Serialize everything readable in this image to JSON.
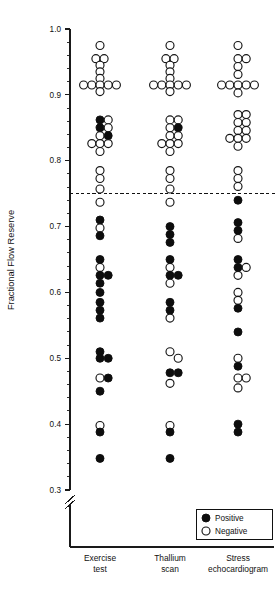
{
  "chart_data": {
    "type": "scatter",
    "title": "",
    "subtitle": "",
    "xlabel": "",
    "ylabel": "Fractional Flow Reserve",
    "ylim": [
      0.3,
      1.0
    ],
    "ytick_labels": [
      "1.0",
      "0.9",
      "0.8",
      "0.7",
      "0.6",
      "0.5",
      "0.4",
      "0.3"
    ],
    "ytick_values": [
      1.0,
      0.9,
      0.8,
      0.7,
      0.6,
      0.5,
      0.4,
      0.3
    ],
    "yminor_step": 0.02,
    "grid": false,
    "axis_break": true,
    "axis_break_note": "y-axis broken below 0.30",
    "threshold": {
      "value": 0.75,
      "style": "dashed",
      "label": ""
    },
    "legend": {
      "position": "bottom-right",
      "entries": [
        {
          "marker": "filled-circle",
          "label": "Positive",
          "color": "#0d0d0d"
        },
        {
          "marker": "open-circle",
          "label": "Negative",
          "color": "#ffffff"
        }
      ]
    },
    "categories": [
      "Exercise test",
      "Thallium scan",
      "Stress echocardiogram"
    ],
    "category_lines": [
      [
        "Exercise",
        "test"
      ],
      [
        "Thallium",
        "scan"
      ],
      [
        "Stress",
        "echocardiogram"
      ]
    ],
    "series": [
      {
        "name": "Exercise test",
        "category_index": 0,
        "points": [
          {
            "y": 0.975,
            "result": "Negative",
            "offset": 0
          },
          {
            "y": 0.955,
            "result": "Negative",
            "offset": -0.5
          },
          {
            "y": 0.955,
            "result": "Negative",
            "offset": 0.5
          },
          {
            "y": 0.945,
            "result": "Negative",
            "offset": 0
          },
          {
            "y": 0.935,
            "result": "Negative",
            "offset": 0
          },
          {
            "y": 0.925,
            "result": "Negative",
            "offset": 0
          },
          {
            "y": 0.915,
            "result": "Negative",
            "offset": -2
          },
          {
            "y": 0.915,
            "result": "Negative",
            "offset": -1
          },
          {
            "y": 0.915,
            "result": "Negative",
            "offset": 0
          },
          {
            "y": 0.915,
            "result": "Negative",
            "offset": 1
          },
          {
            "y": 0.915,
            "result": "Negative",
            "offset": 2
          },
          {
            "y": 0.905,
            "result": "Negative",
            "offset": 0
          },
          {
            "y": 0.862,
            "result": "Positive",
            "offset": 0
          },
          {
            "y": 0.862,
            "result": "Negative",
            "offset": 1
          },
          {
            "y": 0.85,
            "result": "Positive",
            "offset": 0
          },
          {
            "y": 0.85,
            "result": "Negative",
            "offset": 1
          },
          {
            "y": 0.838,
            "result": "Negative",
            "offset": 0
          },
          {
            "y": 0.838,
            "result": "Positive",
            "offset": 1
          },
          {
            "y": 0.826,
            "result": "Negative",
            "offset": -1
          },
          {
            "y": 0.826,
            "result": "Negative",
            "offset": 0
          },
          {
            "y": 0.826,
            "result": "Negative",
            "offset": 1
          },
          {
            "y": 0.814,
            "result": "Negative",
            "offset": 0
          },
          {
            "y": 0.785,
            "result": "Negative",
            "offset": 0
          },
          {
            "y": 0.773,
            "result": "Negative",
            "offset": 0
          },
          {
            "y": 0.757,
            "result": "Negative",
            "offset": 0
          },
          {
            "y": 0.737,
            "result": "Negative",
            "offset": 0
          },
          {
            "y": 0.71,
            "result": "Positive",
            "offset": 0
          },
          {
            "y": 0.698,
            "result": "Negative",
            "offset": 0
          },
          {
            "y": 0.686,
            "result": "Positive",
            "offset": 0
          },
          {
            "y": 0.65,
            "result": "Positive",
            "offset": 0
          },
          {
            "y": 0.638,
            "result": "Negative",
            "offset": 0
          },
          {
            "y": 0.626,
            "result": "Positive",
            "offset": 0
          },
          {
            "y": 0.626,
            "result": "Positive",
            "offset": 1
          },
          {
            "y": 0.614,
            "result": "Positive",
            "offset": 0
          },
          {
            "y": 0.6,
            "result": "Positive",
            "offset": 0
          },
          {
            "y": 0.585,
            "result": "Positive",
            "offset": 0
          },
          {
            "y": 0.573,
            "result": "Positive",
            "offset": 0
          },
          {
            "y": 0.561,
            "result": "Positive",
            "offset": 0
          },
          {
            "y": 0.51,
            "result": "Positive",
            "offset": 0
          },
          {
            "y": 0.5,
            "result": "Positive",
            "offset": 0
          },
          {
            "y": 0.5,
            "result": "Positive",
            "offset": 1
          },
          {
            "y": 0.47,
            "result": "Negative",
            "offset": 0
          },
          {
            "y": 0.47,
            "result": "Positive",
            "offset": 1
          },
          {
            "y": 0.45,
            "result": "Positive",
            "offset": 0
          },
          {
            "y": 0.398,
            "result": "Negative",
            "offset": 0
          },
          {
            "y": 0.388,
            "result": "Positive",
            "offset": 0
          },
          {
            "y": 0.348,
            "result": "Positive",
            "offset": 0
          }
        ]
      },
      {
        "name": "Thallium scan",
        "category_index": 1,
        "points": [
          {
            "y": 0.975,
            "result": "Negative",
            "offset": 0
          },
          {
            "y": 0.955,
            "result": "Negative",
            "offset": -0.5
          },
          {
            "y": 0.955,
            "result": "Negative",
            "offset": 0.5
          },
          {
            "y": 0.945,
            "result": "Negative",
            "offset": 0
          },
          {
            "y": 0.935,
            "result": "Negative",
            "offset": 0
          },
          {
            "y": 0.925,
            "result": "Negative",
            "offset": 0
          },
          {
            "y": 0.915,
            "result": "Negative",
            "offset": -2
          },
          {
            "y": 0.915,
            "result": "Negative",
            "offset": -1
          },
          {
            "y": 0.915,
            "result": "Negative",
            "offset": 0
          },
          {
            "y": 0.915,
            "result": "Negative",
            "offset": 1
          },
          {
            "y": 0.915,
            "result": "Negative",
            "offset": 2
          },
          {
            "y": 0.905,
            "result": "Negative",
            "offset": 0
          },
          {
            "y": 0.862,
            "result": "Negative",
            "offset": 0
          },
          {
            "y": 0.862,
            "result": "Negative",
            "offset": 1
          },
          {
            "y": 0.85,
            "result": "Negative",
            "offset": 0
          },
          {
            "y": 0.85,
            "result": "Positive",
            "offset": 1
          },
          {
            "y": 0.838,
            "result": "Negative",
            "offset": 0
          },
          {
            "y": 0.838,
            "result": "Negative",
            "offset": 1
          },
          {
            "y": 0.826,
            "result": "Negative",
            "offset": -1
          },
          {
            "y": 0.826,
            "result": "Negative",
            "offset": 0
          },
          {
            "y": 0.826,
            "result": "Negative",
            "offset": 1
          },
          {
            "y": 0.814,
            "result": "Negative",
            "offset": 0
          },
          {
            "y": 0.785,
            "result": "Negative",
            "offset": 0
          },
          {
            "y": 0.773,
            "result": "Negative",
            "offset": 0
          },
          {
            "y": 0.757,
            "result": "Negative",
            "offset": 0
          },
          {
            "y": 0.737,
            "result": "Negative",
            "offset": 0
          },
          {
            "y": 0.7,
            "result": "Positive",
            "offset": 0
          },
          {
            "y": 0.688,
            "result": "Positive",
            "offset": 0
          },
          {
            "y": 0.676,
            "result": "Positive",
            "offset": 0
          },
          {
            "y": 0.65,
            "result": "Positive",
            "offset": 0
          },
          {
            "y": 0.638,
            "result": "Negative",
            "offset": 0
          },
          {
            "y": 0.626,
            "result": "Positive",
            "offset": 0
          },
          {
            "y": 0.626,
            "result": "Positive",
            "offset": 1
          },
          {
            "y": 0.614,
            "result": "Negative",
            "offset": 0
          },
          {
            "y": 0.585,
            "result": "Positive",
            "offset": 0
          },
          {
            "y": 0.573,
            "result": "Positive",
            "offset": 0
          },
          {
            "y": 0.561,
            "result": "Negative",
            "offset": 0
          },
          {
            "y": 0.51,
            "result": "Negative",
            "offset": 0
          },
          {
            "y": 0.5,
            "result": "Negative",
            "offset": 1
          },
          {
            "y": 0.478,
            "result": "Positive",
            "offset": 0
          },
          {
            "y": 0.478,
            "result": "Positive",
            "offset": 1
          },
          {
            "y": 0.462,
            "result": "Negative",
            "offset": 0
          },
          {
            "y": 0.398,
            "result": "Negative",
            "offset": 0
          },
          {
            "y": 0.388,
            "result": "Positive",
            "offset": 0
          },
          {
            "y": 0.348,
            "result": "Positive",
            "offset": 0
          }
        ]
      },
      {
        "name": "Stress echocardiogram",
        "category_index": 2,
        "points": [
          {
            "y": 0.975,
            "result": "Negative",
            "offset": 0
          },
          {
            "y": 0.955,
            "result": "Negative",
            "offset": 0
          },
          {
            "y": 0.955,
            "result": "Negative",
            "offset": 1
          },
          {
            "y": 0.943,
            "result": "Negative",
            "offset": 0
          },
          {
            "y": 0.931,
            "result": "Negative",
            "offset": 0
          },
          {
            "y": 0.915,
            "result": "Negative",
            "offset": -2
          },
          {
            "y": 0.915,
            "result": "Negative",
            "offset": -1
          },
          {
            "y": 0.915,
            "result": "Negative",
            "offset": 0
          },
          {
            "y": 0.915,
            "result": "Negative",
            "offset": 1
          },
          {
            "y": 0.915,
            "result": "Negative",
            "offset": 2
          },
          {
            "y": 0.903,
            "result": "Negative",
            "offset": 0
          },
          {
            "y": 0.87,
            "result": "Negative",
            "offset": 0
          },
          {
            "y": 0.87,
            "result": "Negative",
            "offset": 1
          },
          {
            "y": 0.858,
            "result": "Negative",
            "offset": 0
          },
          {
            "y": 0.858,
            "result": "Negative",
            "offset": 1
          },
          {
            "y": 0.846,
            "result": "Negative",
            "offset": 0
          },
          {
            "y": 0.846,
            "result": "Negative",
            "offset": 1
          },
          {
            "y": 0.834,
            "result": "Negative",
            "offset": -1
          },
          {
            "y": 0.834,
            "result": "Negative",
            "offset": 0
          },
          {
            "y": 0.834,
            "result": "Negative",
            "offset": 1
          },
          {
            "y": 0.822,
            "result": "Negative",
            "offset": 0
          },
          {
            "y": 0.785,
            "result": "Negative",
            "offset": 0
          },
          {
            "y": 0.773,
            "result": "Negative",
            "offset": 0
          },
          {
            "y": 0.761,
            "result": "Negative",
            "offset": 0
          },
          {
            "y": 0.74,
            "result": "Positive",
            "offset": 0
          },
          {
            "y": 0.706,
            "result": "Positive",
            "offset": 0
          },
          {
            "y": 0.694,
            "result": "Positive",
            "offset": 0
          },
          {
            "y": 0.682,
            "result": "Negative",
            "offset": 0
          },
          {
            "y": 0.65,
            "result": "Positive",
            "offset": 0
          },
          {
            "y": 0.638,
            "result": "Positive",
            "offset": 0
          },
          {
            "y": 0.638,
            "result": "Negative",
            "offset": 1
          },
          {
            "y": 0.626,
            "result": "Negative",
            "offset": 0
          },
          {
            "y": 0.6,
            "result": "Negative",
            "offset": 0
          },
          {
            "y": 0.588,
            "result": "Negative",
            "offset": 0
          },
          {
            "y": 0.576,
            "result": "Positive",
            "offset": 0
          },
          {
            "y": 0.54,
            "result": "Positive",
            "offset": 0
          },
          {
            "y": 0.5,
            "result": "Negative",
            "offset": 0
          },
          {
            "y": 0.488,
            "result": "Positive",
            "offset": 0
          },
          {
            "y": 0.47,
            "result": "Negative",
            "offset": 0
          },
          {
            "y": 0.47,
            "result": "Negative",
            "offset": 1
          },
          {
            "y": 0.455,
            "result": "Negative",
            "offset": 0
          },
          {
            "y": 0.4,
            "result": "Positive",
            "offset": 0
          },
          {
            "y": 0.388,
            "result": "Positive",
            "offset": 0
          }
        ]
      }
    ]
  }
}
